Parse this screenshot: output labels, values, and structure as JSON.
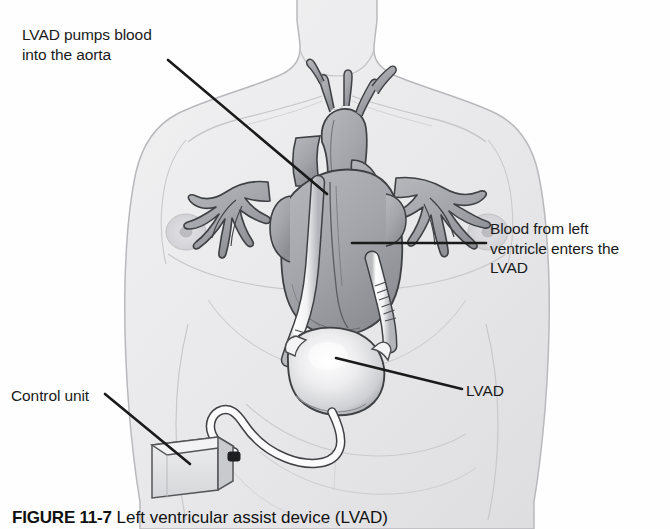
{
  "figure": {
    "caption_number": "FIGURE 11-7",
    "caption_text": "  Left ventricular assist device (LVAD)",
    "alt": "Grayscale medical illustration of a male torso showing an implanted left ventricular assist device connected to the heart, with a driveline running to an external control unit at the waist."
  },
  "labels": {
    "aorta": "LVAD pumps blood\ninto the aorta",
    "inflow": "Blood from left\nventricle enters the\nLVAD",
    "lvad": "LVAD",
    "control_unit": "Control unit"
  },
  "parts": {
    "torso": "torso-outline",
    "heart": "heart-anatomy",
    "aorta_vessel": "aorta",
    "pulmonary_vessels": "pulmonary-vessels",
    "outflow_cannula": "outflow-cannula",
    "inflow_cannula": "inflow-cannula",
    "pump": "lvad-pump",
    "driveline": "driveline-cable",
    "control_unit": "control-unit-box",
    "connector": "driveline-connector"
  },
  "colors": {
    "skin_fill": "#ededee",
    "skin_line": "#b9b9bd",
    "heart_fill": "#a9aaae",
    "heart_dark": "#8e9095",
    "heart_line": "#3f4044",
    "tube_fill": "#fbfbfc",
    "tube_line": "#4a4b4f",
    "pump_fill": "#dedee1",
    "leader_line": "#1a1a1a",
    "text": "#1a1a1a",
    "background": "#fefefe"
  }
}
